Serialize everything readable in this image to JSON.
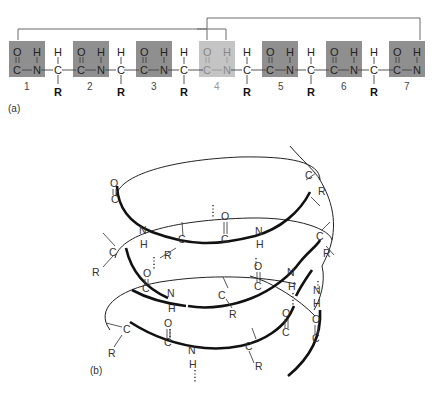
{
  "panel_a": {
    "label": "(a)",
    "units": [
      {
        "number": "1",
        "top_left": "O",
        "top_right": "H",
        "bottom_left": "C",
        "bottom_right": "N",
        "highlight": false
      },
      {
        "number": "2",
        "top_left": "O",
        "top_right": "H",
        "bottom_left": "C",
        "bottom_right": "N",
        "highlight": false
      },
      {
        "number": "3",
        "top_left": "O",
        "top_right": "H",
        "bottom_left": "C",
        "bottom_right": "N",
        "highlight": false
      },
      {
        "number": "4",
        "top_left": "O",
        "top_right": "H",
        "bottom_left": "C",
        "bottom_right": "N",
        "highlight": true
      },
      {
        "number": "5",
        "top_left": "O",
        "top_right": "H",
        "bottom_left": "C",
        "bottom_right": "N",
        "highlight": false
      },
      {
        "number": "6",
        "top_left": "O",
        "top_right": "H",
        "bottom_left": "C",
        "bottom_right": "N",
        "highlight": false
      },
      {
        "number": "7",
        "top_left": "O",
        "top_right": "H",
        "bottom_left": "C",
        "bottom_right": "N",
        "highlight": false
      }
    ],
    "alpha_carbons": [
      {
        "top": "H",
        "center": "C",
        "bottom": "R"
      },
      {
        "top": "H",
        "center": "C",
        "bottom": "R"
      },
      {
        "top": "H",
        "center": "C",
        "bottom": "R"
      },
      {
        "top": "H",
        "center": "C",
        "bottom": "R"
      },
      {
        "top": "H",
        "center": "C",
        "bottom": "R"
      },
      {
        "top": "H",
        "center": "C",
        "bottom": "R"
      }
    ],
    "hydrogen_bonds": [
      {
        "from_unit": "1",
        "to_unit": "4"
      },
      {
        "from_unit": "4",
        "to_unit": "7"
      }
    ],
    "colors": {
      "box_dark": "#8f8f8f",
      "box_light": "#c4c4c4",
      "connector": "#6a6a6a"
    }
  },
  "panel_b": {
    "label": "(b)",
    "atoms": {
      "O": "O",
      "C": "C",
      "N": "N",
      "H": "H",
      "R": "R"
    }
  }
}
